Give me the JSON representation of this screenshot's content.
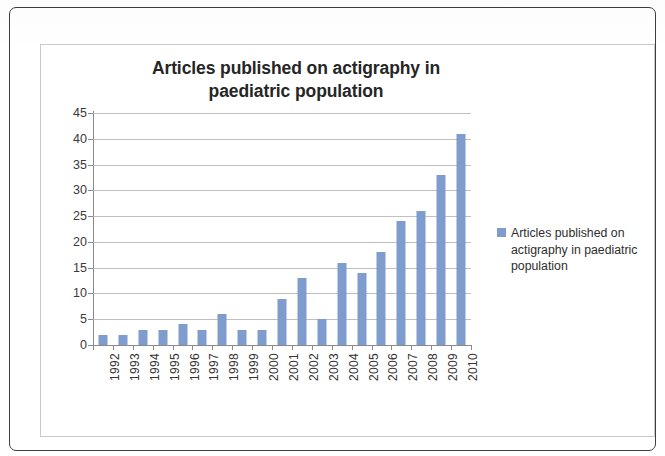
{
  "figure": {
    "title_line1": "Articles published on actigraphy in",
    "title_line2": "paediatric population",
    "bar_color": "#7e9cce",
    "gridline_color": "#b5b5b5",
    "axis_color": "#8a8a8a"
  },
  "legend": {
    "label": "Articles published on actigraphy in paediatric population",
    "swatch_name": "legend-color-swatch"
  },
  "chart_data": {
    "type": "bar",
    "title": "Articles published on actigraphy in paediatric population",
    "xlabel": "",
    "ylabel": "",
    "ylim": [
      0,
      45
    ],
    "ytick_step": 5,
    "yticks": [
      0,
      5,
      10,
      15,
      20,
      25,
      30,
      35,
      40,
      45
    ],
    "grid": true,
    "legend_position": "right",
    "categories": [
      "1992",
      "1993",
      "1994",
      "1995",
      "1996",
      "1997",
      "1998",
      "1999",
      "2000",
      "2001",
      "2002",
      "2003",
      "2004",
      "2005",
      "2006",
      "2007",
      "2008",
      "2009",
      "2010"
    ],
    "series": [
      {
        "name": "Articles published on actigraphy in paediatric population",
        "values": [
          2,
          2,
          3,
          3,
          4,
          3,
          6,
          3,
          3,
          9,
          13,
          5,
          16,
          14,
          18,
          24,
          26,
          33,
          41
        ],
        "color": "#7e9cce"
      }
    ]
  }
}
